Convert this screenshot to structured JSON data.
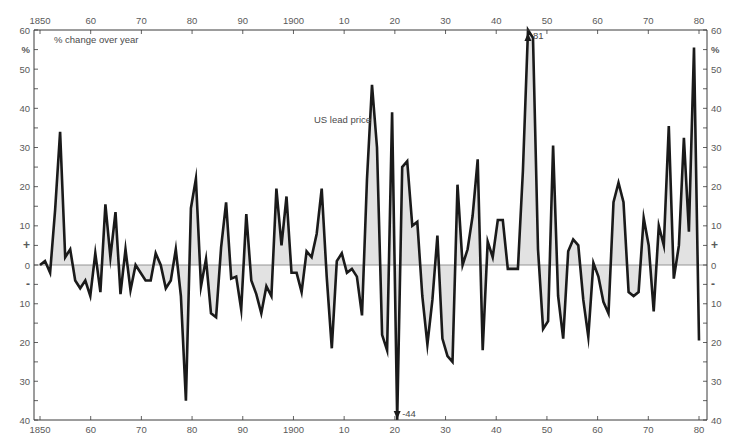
{
  "chart_data": {
    "type": "area",
    "title": "",
    "series_label": "US lead price",
    "ylabel": "% change over year",
    "y_unit": "%",
    "xlabel": "",
    "xlim": [
      1850,
      1980
    ],
    "ylim": [
      -40,
      60
    ],
    "grid": false,
    "legend": "none",
    "zero_line": true,
    "x_ticks": [
      1850,
      1860,
      1870,
      1880,
      1890,
      1900,
      1910,
      1920,
      1930,
      1940,
      1950,
      1960,
      1970,
      1980
    ],
    "x_tick_labels": [
      "1850",
      "60",
      "70",
      "80",
      "90",
      "1900",
      "10",
      "20",
      "30",
      "40",
      "50",
      "60",
      "70",
      "80"
    ],
    "y_tick_labels": [
      {
        "value": 60,
        "label": "60"
      },
      {
        "value": 55,
        "label": "%"
      },
      {
        "value": 50,
        "label": "50"
      },
      {
        "value": 40,
        "label": "40"
      },
      {
        "value": 30,
        "label": "30"
      },
      {
        "value": 20,
        "label": "20"
      },
      {
        "value": 10,
        "label": "10"
      },
      {
        "value": 5,
        "label": "+"
      },
      {
        "value": 0,
        "label": "0"
      },
      {
        "value": -5,
        "label": "-"
      },
      {
        "value": -10,
        "label": "10"
      },
      {
        "value": -20,
        "label": "20"
      },
      {
        "value": -30,
        "label": "30"
      },
      {
        "value": -40,
        "label": "40"
      }
    ],
    "annotations": [
      {
        "x": 1947,
        "value": 81,
        "label": "81",
        "direction": "up",
        "note": "off-scale peak"
      },
      {
        "x": 1921,
        "value": -44,
        "label": "-44",
        "direction": "down",
        "note": "off-scale trough"
      }
    ],
    "x_start": 1850,
    "values": [
      0,
      1,
      -2,
      14,
      34,
      2,
      4,
      -4,
      -6,
      -4,
      -8,
      3,
      -7,
      15.5,
      2,
      13.5,
      -7.5,
      4,
      -6.5,
      0,
      -2,
      -4,
      -4,
      3,
      0,
      -6,
      -4,
      4,
      -8,
      -35,
      14.5,
      22,
      -5.5,
      1.5,
      -12.5,
      -13.5,
      4.5,
      16,
      -3.5,
      -3,
      -11.5,
      13,
      -4,
      -7.5,
      -12.5,
      -5.5,
      -8,
      19.5,
      5,
      17.5,
      -2,
      -2,
      -7,
      3.5,
      2,
      8,
      19.5,
      -3,
      -21.5,
      1,
      3,
      -2,
      -1,
      -3,
      -13,
      22,
      46,
      30,
      -18,
      -22,
      39,
      -44,
      25,
      26.5,
      10,
      11,
      -8,
      -20.5,
      -9,
      7.5,
      -19,
      -23.5,
      -25,
      20.5,
      0,
      4,
      12.5,
      27,
      -22,
      6,
      2,
      11.5,
      11.5,
      -1,
      -1,
      -1,
      24,
      81,
      58,
      4,
      -16.5,
      -14.5,
      30.5,
      -8,
      -19,
      3.5,
      6.5,
      5,
      -9,
      -18.5,
      0.5,
      -3,
      -9.5,
      -12.5,
      16,
      21,
      16,
      -7,
      -8,
      -7,
      12,
      5,
      -12,
      10,
      5,
      35.5,
      -3.5,
      5,
      32.5,
      8.5,
      55.5,
      -19.5
    ]
  },
  "labels": {
    "ylabel": "% change over year",
    "series": "US lead price",
    "peak_annotation": "81",
    "trough_annotation": "-44"
  },
  "colors": {
    "line": "#1a1a1a",
    "fill": "#e2e2e2",
    "axis": "#3a3a3a",
    "text": "#5a5a5a",
    "zero_line": "#8a8a8a"
  }
}
